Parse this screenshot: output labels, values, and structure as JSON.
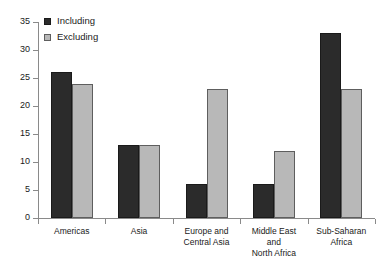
{
  "chart_data": {
    "type": "bar",
    "title": "",
    "xlabel": "",
    "ylabel": "",
    "ylim": [
      0,
      35
    ],
    "ytick_step": 5,
    "yticks": [
      "35",
      "30",
      "25",
      "20",
      "15",
      "10",
      "5",
      "0"
    ],
    "grid": false,
    "legend_position": "top-left",
    "categories": [
      "Americas",
      "Asia",
      "Europe and\nCentral Asia",
      "Middle East\nand\nNorth Africa",
      "Sub-Saharan\nAfrica"
    ],
    "series": [
      {
        "name": "Including",
        "color": "#2b2b2b",
        "values": [
          26,
          13,
          6,
          6,
          33
        ]
      },
      {
        "name": "Excluding",
        "color": "#b8b8b8",
        "values": [
          24,
          13,
          23,
          12,
          23
        ]
      }
    ]
  },
  "legend": {
    "items": [
      {
        "label": "Including"
      },
      {
        "label": "Excluding"
      }
    ]
  },
  "colors": {
    "including": "#2b2b2b",
    "excluding": "#b8b8b8",
    "axis": "#8a8a8a",
    "text": "#1a1a1a",
    "background": "#ffffff"
  }
}
